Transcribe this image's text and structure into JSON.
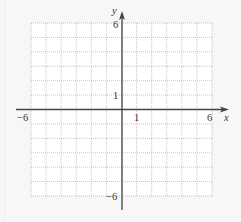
{
  "chart_data": {
    "type": "scatter",
    "title": "",
    "xlabel": "x",
    "ylabel": "y",
    "xlim": [
      -6,
      6
    ],
    "ylim": [
      -6,
      6
    ],
    "grid": true,
    "grid_style": "dotted",
    "grid_step": 1,
    "x_tick_labels": [
      "−6",
      "1",
      "6"
    ],
    "y_tick_labels": [
      "6",
      "1",
      "−6"
    ],
    "x_ticks": [
      -6,
      1,
      6
    ],
    "y_ticks": [
      6,
      1,
      -6
    ],
    "series": [],
    "legend": null
  },
  "labels": {
    "x_axis": "x",
    "y_axis": "y",
    "x_min": "−6",
    "x_one": "1",
    "x_max": "6",
    "y_max": "6",
    "y_one": "1",
    "y_min": "−6"
  },
  "colors": {
    "background": "#f7f7f7",
    "plot_area": "#ffffff",
    "grid": "#b8b8b8",
    "axis": "#444444",
    "text": "#333333"
  }
}
